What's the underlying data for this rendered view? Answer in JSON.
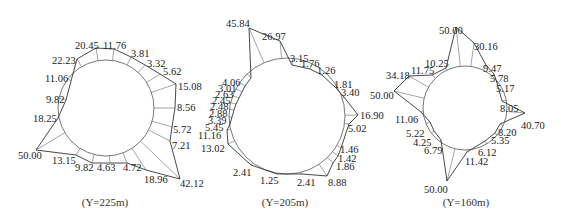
{
  "diagrams": [
    {
      "caption": "(Y=225m)",
      "caption_pos": [
        105,
        206
      ],
      "center": [
        106,
        108
      ],
      "radius": 48,
      "points": [
        {
          "label": "20.45",
          "x": 96,
          "y": 48,
          "lx": 75,
          "ly": 49
        },
        {
          "label": "11.76",
          "x": 114,
          "y": 49,
          "lx": 103,
          "ly": 49
        },
        {
          "label": "3.81",
          "x": 131,
          "y": 57,
          "lx": 131,
          "ly": 57
        },
        {
          "label": "3.32",
          "x": 145,
          "y": 65,
          "lx": 147,
          "ly": 67
        },
        {
          "label": "5.62",
          "x": 160,
          "y": 74,
          "lx": 163,
          "ly": 75
        },
        {
          "label": "15.08",
          "x": 176,
          "y": 84,
          "lx": 178,
          "ly": 90
        },
        {
          "label": "8.56",
          "x": 175,
          "y": 108,
          "lx": 177,
          "ly": 111
        },
        {
          "label": "5.72",
          "x": 172,
          "y": 127,
          "lx": 173,
          "ly": 133
        },
        {
          "label": "7.21",
          "x": 170,
          "y": 141,
          "lx": 172,
          "ly": 149
        },
        {
          "label": "42.12",
          "x": 180,
          "y": 179,
          "lx": 180,
          "ly": 187
        },
        {
          "label": "18.96",
          "x": 146,
          "y": 170,
          "lx": 144,
          "ly": 183
        },
        {
          "label": "4.72",
          "x": 127,
          "y": 163,
          "lx": 123,
          "ly": 171
        },
        {
          "label": "4.63",
          "x": 110,
          "y": 163,
          "lx": 97,
          "ly": 171
        },
        {
          "label": "9.82",
          "x": 92,
          "y": 163,
          "lx": 75,
          "ly": 171
        },
        {
          "label": "13.15",
          "x": 76,
          "y": 155,
          "lx": 52,
          "ly": 164
        },
        {
          "label": "50.00",
          "x": 36,
          "y": 150,
          "lx": 18,
          "ly": 159
        },
        {
          "label": "18.25",
          "x": 58,
          "y": 118,
          "lx": 33,
          "ly": 122
        },
        {
          "label": "9.82",
          "x": 66,
          "y": 100,
          "lx": 46,
          "ly": 103
        },
        {
          "label": "11.06",
          "x": 71,
          "y": 81,
          "lx": 45,
          "ly": 82
        },
        {
          "label": "22.23",
          "x": 77,
          "y": 59,
          "lx": 52,
          "ly": 64
        }
      ]
    },
    {
      "caption": "(Y=205m)",
      "caption_pos": [
        285,
        206
      ],
      "center": [
        287,
        116
      ],
      "radius": 58,
      "points": [
        {
          "label": "45.84",
          "x": 249,
          "y": 28,
          "lx": 226,
          "ly": 27
        },
        {
          "label": "26.97",
          "x": 280,
          "y": 41,
          "lx": 262,
          "ly": 40
        },
        {
          "label": "3.15",
          "x": 292,
          "y": 65,
          "lx": 290,
          "ly": 62
        },
        {
          "label": "1.76",
          "x": 310,
          "y": 69,
          "lx": 301,
          "ly": 67
        },
        {
          "label": "1.26",
          "x": 322,
          "y": 75,
          "lx": 317,
          "ly": 74
        },
        {
          "label": "1.81",
          "x": 336,
          "y": 88,
          "lx": 334,
          "ly": 88
        },
        {
          "label": "3.40",
          "x": 344,
          "y": 97,
          "lx": 341,
          "ly": 96
        },
        {
          "label": "16.90",
          "x": 358,
          "y": 115,
          "lx": 360,
          "ly": 119
        },
        {
          "label": "5.02",
          "x": 349,
          "y": 124,
          "lx": 348,
          "ly": 132
        },
        {
          "label": "1.46",
          "x": 341,
          "y": 148,
          "lx": 340,
          "ly": 153
        },
        {
          "label": "1.42",
          "x": 338,
          "y": 156,
          "lx": 338,
          "ly": 162
        },
        {
          "label": "1.86",
          "x": 333,
          "y": 163,
          "lx": 336,
          "ly": 170
        },
        {
          "label": "8.88",
          "x": 327,
          "y": 176,
          "lx": 328,
          "ly": 186
        },
        {
          "label": "2.41",
          "x": 302,
          "y": 174,
          "lx": 297,
          "ly": 186
        },
        {
          "label": "1.25",
          "x": 277,
          "y": 174,
          "lx": 260,
          "ly": 184
        },
        {
          "label": "2.41",
          "x": 251,
          "y": 165,
          "lx": 233,
          "ly": 176
        },
        {
          "label": "13.02",
          "x": 228,
          "y": 144,
          "lx": 201,
          "ly": 152
        },
        {
          "label": "11.16",
          "x": 227,
          "y": 130,
          "lx": 198,
          "ly": 139
        },
        {
          "label": "5.45",
          "x": 230,
          "y": 124,
          "lx": 205,
          "ly": 131
        },
        {
          "label": "3.39",
          "x": 232,
          "y": 117,
          "lx": 208,
          "ly": 124
        },
        {
          "label": "2.88",
          "x": 234,
          "y": 110,
          "lx": 209,
          "ly": 117
        },
        {
          "label": "2.48",
          "x": 236,
          "y": 104,
          "lx": 210,
          "ly": 110
        },
        {
          "label": "2.45",
          "x": 239,
          "y": 98,
          "lx": 212,
          "ly": 104
        },
        {
          "label": "2.63",
          "x": 242,
          "y": 92,
          "lx": 215,
          "ly": 98
        },
        {
          "label": "3.01",
          "x": 245,
          "y": 86,
          "lx": 218,
          "ly": 92
        },
        {
          "label": "4.06",
          "x": 251,
          "y": 78,
          "lx": 222,
          "ly": 86
        }
      ]
    },
    {
      "caption": "(Y=160m)",
      "caption_pos": [
        466,
        206
      ],
      "center": [
        465,
        108
      ],
      "radius": 42,
      "points": [
        {
          "label": "50.00",
          "x": 456,
          "y": 27,
          "lx": 439,
          "ly": 34
        },
        {
          "label": "30.16",
          "x": 474,
          "y": 43,
          "lx": 474,
          "ly": 50
        },
        {
          "label": "9.47",
          "x": 486,
          "y": 65,
          "lx": 483,
          "ly": 72
        },
        {
          "label": "5.78",
          "x": 494,
          "y": 74,
          "lx": 490,
          "ly": 82
        },
        {
          "label": "5.17",
          "x": 497,
          "y": 83,
          "lx": 496,
          "ly": 92
        },
        {
          "label": "8.05",
          "x": 502,
          "y": 101,
          "lx": 500,
          "ly": 112
        },
        {
          "label": "40.70",
          "x": 525,
          "y": 113,
          "lx": 521,
          "ly": 129
        },
        {
          "label": "8.20",
          "x": 500,
          "y": 124,
          "lx": 498,
          "ly": 136
        },
        {
          "label": "5.35",
          "x": 495,
          "y": 133,
          "lx": 491,
          "ly": 144
        },
        {
          "label": "6.12",
          "x": 485,
          "y": 141,
          "lx": 478,
          "ly": 156
        },
        {
          "label": "11.42",
          "x": 467,
          "y": 152,
          "lx": 465,
          "ly": 165
        },
        {
          "label": "50.00",
          "x": 447,
          "y": 181,
          "lx": 424,
          "ly": 193
        },
        {
          "label": "6.79",
          "x": 441,
          "y": 140,
          "lx": 424,
          "ly": 154
        },
        {
          "label": "4.25",
          "x": 434,
          "y": 131,
          "lx": 413,
          "ly": 146
        },
        {
          "label": "5.22",
          "x": 430,
          "y": 122,
          "lx": 406,
          "ly": 137
        },
        {
          "label": "11.06",
          "x": 421,
          "y": 112,
          "lx": 395,
          "ly": 123
        },
        {
          "label": "50.00",
          "x": 394,
          "y": 91,
          "lx": 370,
          "ly": 99
        },
        {
          "label": "34.18",
          "x": 409,
          "y": 76,
          "lx": 386,
          "ly": 79
        },
        {
          "label": "11.75",
          "x": 432,
          "y": 75,
          "lx": 411,
          "ly": 74
        },
        {
          "label": "10.25",
          "x": 446,
          "y": 68,
          "lx": 425,
          "ly": 67
        }
      ]
    }
  ]
}
